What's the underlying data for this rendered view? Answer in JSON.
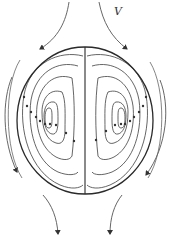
{
  "diagram": {
    "title": "",
    "labels": {
      "velocity": "V"
    },
    "colors": {
      "boundary": "#2a2a2a",
      "streamline": "#4a4a4a",
      "background": "#ffffff"
    },
    "elements": {
      "sphere_boundary": "circle",
      "axis_line": "vertical diameter",
      "internal_vortices": [
        "left-vortex",
        "right-vortex"
      ],
      "external_flow_arrows": [
        "top-left",
        "top-right",
        "left-side",
        "right-side",
        "bottom-left",
        "bottom-right"
      ]
    }
  }
}
